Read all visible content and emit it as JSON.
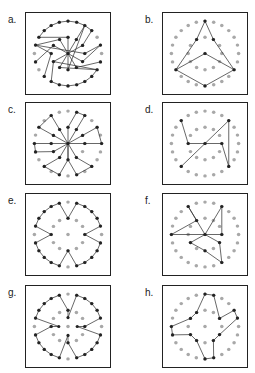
{
  "grid": {
    "outer_count": 24,
    "outer_r": 40,
    "inner_count": 12,
    "inner_r": 20,
    "center": true,
    "dot_color": "#a8a8a8",
    "line_color": "#333333",
    "node_color": "#222222"
  },
  "panels": [
    {
      "label": "a.",
      "x": 25,
      "y": 12,
      "lx": 8,
      "ly": 14,
      "paths": [
        [
          "O20",
          "O21",
          "O22",
          "O23",
          "O0",
          "O1",
          "O2",
          "O3",
          "I2",
          "C"
        ],
        [
          "O2",
          "I1",
          "C"
        ],
        [
          "O14",
          "O13",
          "O12",
          "O11",
          "O10",
          "O9",
          "O8",
          "I8",
          "C"
        ],
        [
          "O8",
          "I7",
          "C"
        ],
        [
          "O19",
          "I3",
          "O5",
          "I4",
          "C"
        ],
        [
          "O17",
          "I10",
          "C"
        ],
        [
          "O7",
          "I5",
          "C"
        ],
        [
          "O19",
          "I11",
          "C"
        ],
        [
          "O15",
          "I9",
          "O19"
        ],
        [
          "O14",
          "I8"
        ],
        [
          "O20",
          "I0",
          "C"
        ],
        [
          "O2",
          "I6",
          "C"
        ]
      ]
    },
    {
      "label": "b.",
      "x": 162,
      "y": 12,
      "lx": 145,
      "ly": 14,
      "paths": [
        [
          "O0",
          "I1",
          "O8",
          "O12",
          "O16",
          "I11",
          "O0"
        ],
        [
          "O16",
          "C",
          "O8"
        ]
      ]
    },
    {
      "label": "c.",
      "x": 25,
      "y": 102,
      "lx": 8,
      "ly": 104,
      "paths": [
        [
          "C",
          "I1",
          "O2",
          "O1",
          "I0",
          "C"
        ],
        [
          "C",
          "I2",
          "O4",
          "O6",
          "I3",
          "C"
        ],
        [
          "C",
          "I5",
          "O9",
          "O11",
          "I6",
          "C"
        ],
        [
          "C",
          "I6",
          "O13",
          "O15",
          "I7",
          "C"
        ],
        [
          "C",
          "I9",
          "O18",
          "O17",
          "I8",
          "C"
        ],
        [
          "C",
          "I10",
          "O20",
          "O22",
          "I11",
          "C"
        ]
      ]
    },
    {
      "label": "d.",
      "x": 162,
      "y": 102,
      "lx": 145,
      "ly": 104,
      "paths": [
        [
          "O21",
          "I9",
          "C",
          "I3",
          "O9",
          "O3",
          "C",
          "O15"
        ]
      ]
    },
    {
      "label": "e.",
      "x": 25,
      "y": 193,
      "lx": 8,
      "ly": 195,
      "paths": [
        [
          "O1",
          "O2",
          "O3",
          "O4",
          "O5",
          "I3",
          "O7",
          "O8",
          "O9",
          "O10",
          "O11",
          "I6",
          "O13",
          "O14",
          "O15",
          "O16",
          "O17",
          "I9",
          "O19",
          "O20",
          "O21",
          "O22",
          "O23",
          "I0",
          "O1"
        ]
      ]
    },
    {
      "label": "f.",
      "x": 162,
      "y": 193,
      "lx": 145,
      "ly": 195,
      "paths": [
        [
          "O18",
          "I11",
          "O22",
          "C",
          "O18"
        ],
        [
          "C",
          "O2",
          "I3",
          "C"
        ],
        [
          "C",
          "I8",
          "I6",
          "O10",
          "I4",
          "C"
        ]
      ]
    },
    {
      "label": "g.",
      "x": 25,
      "y": 285,
      "lx": 8,
      "ly": 287,
      "paths": [
        [
          "O1",
          "O2",
          "O3",
          "O4",
          "O5",
          "I3",
          "I3b",
          "O7",
          "O8",
          "O9",
          "O10",
          "O11",
          "I6",
          "I6b",
          "O13",
          "O14",
          "O15",
          "O16",
          "O17",
          "I9",
          "I9b",
          "O19",
          "O20",
          "O21",
          "O22",
          "O23",
          "I0",
          "I0b",
          "O1"
        ]
      ]
    },
    {
      "label": "h.",
      "x": 162,
      "y": 285,
      "lx": 145,
      "ly": 287,
      "paths": [
        [
          "O0",
          "O1",
          "I2",
          "O4",
          "O5",
          "I4",
          "I5",
          "O11",
          "O12",
          "I7",
          "I8",
          "O17",
          "O18",
          "I10",
          "I11",
          "O0"
        ]
      ]
    }
  ]
}
